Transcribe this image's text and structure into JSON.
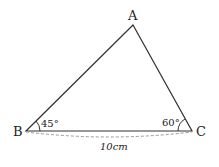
{
  "diagram": {
    "type": "triangle",
    "vertices": {
      "A": {
        "label": "A",
        "x": 133,
        "y": 25
      },
      "B": {
        "label": "B",
        "x": 26,
        "y": 131
      },
      "C": {
        "label": "C",
        "x": 192,
        "y": 131
      }
    },
    "angles": {
      "B": "45°",
      "C": "60°"
    },
    "side_BC_label": "10cm",
    "colors": {
      "stroke": "#333333",
      "dashed": "#888888"
    }
  }
}
